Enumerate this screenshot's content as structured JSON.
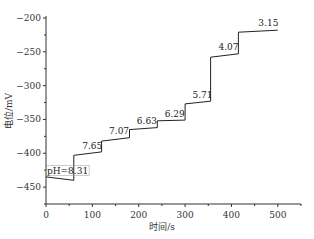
{
  "chart_data": {
    "type": "line",
    "title": "",
    "xlabel": "时间/s",
    "ylabel": "电位/mV",
    "xlim": [
      0,
      550
    ],
    "ylim": [
      -475,
      -200
    ],
    "xticks": [
      0,
      100,
      200,
      300,
      400,
      500
    ],
    "yticks": [
      -200,
      -250,
      -300,
      -350,
      -400,
      -450
    ],
    "grid": false,
    "legend": null,
    "series": [
      {
        "name": "potential",
        "color": "#222222",
        "x": [
          0,
          60,
          60,
          120,
          120,
          180,
          180,
          240,
          240,
          300,
          300,
          355,
          355,
          415,
          415,
          500
        ],
        "y": [
          -435,
          -440,
          -403,
          -398,
          -382,
          -377,
          -365,
          -362,
          -352,
          -351,
          -327,
          -323,
          -258,
          -253,
          -221,
          -218
        ]
      }
    ],
    "annotations": [
      {
        "text": "pH=8.31",
        "x": 2,
        "y": -430,
        "boxed": true
      },
      {
        "text": "7.65",
        "x": 78,
        "y": -393
      },
      {
        "text": "7.07",
        "x": 136,
        "y": -372
      },
      {
        "text": "6.63",
        "x": 196,
        "y": -357
      },
      {
        "text": "6.29",
        "x": 256,
        "y": -346
      },
      {
        "text": "5.71",
        "x": 316,
        "y": -318
      },
      {
        "text": "4.07",
        "x": 372,
        "y": -247
      },
      {
        "text": "3.15",
        "x": 458,
        "y": -212
      }
    ]
  }
}
